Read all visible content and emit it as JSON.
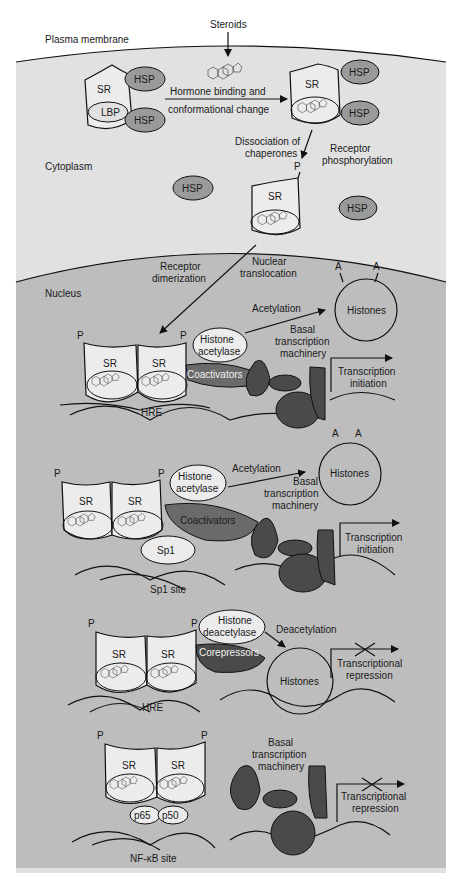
{
  "regions": {
    "plasma_membrane": "Plasma membrane",
    "cytoplasm": "Cytoplasm",
    "nucleus": "Nucleus"
  },
  "colors": {
    "cytoplasm": "#e1e1e1",
    "nucleus": "#bdbdbd",
    "receptor": "#e8e8e8",
    "hsp": "#9a9a9a",
    "dark_protein": "#4a4a4a",
    "coactivator": "#6a6a6a",
    "light_protein": "#ececec"
  },
  "cytoplasm_step": {
    "steroids": "Steroids",
    "sr": "SR",
    "lbp": "LBP",
    "hsp": "HSP",
    "hormone_binding_line1": "Hormone binding and",
    "hormone_binding_line2": "conformational change",
    "dissociation_line1": "Dissociation of",
    "dissociation_line2": "chaperones",
    "phospho_line1": "Receptor",
    "phospho_line2": "phosphorylation",
    "p": "P",
    "nuclear_line1": "Nuclear",
    "nuclear_line2": "translocation",
    "dimer_line1": "Receptor",
    "dimer_line2": "dimerization"
  },
  "panel1": {
    "sr": "SR",
    "p": "P",
    "histone_acetylase_line1": "Histone",
    "histone_acetylase_line2": "acetylase",
    "coactivators": "Coactivators",
    "acetylation": "Acetylation",
    "histones": "Histones",
    "a": "A",
    "basal_line1": "Basal",
    "basal_line2": "transcription",
    "basal_line3": "machinery",
    "tx_line1": "Transcription",
    "tx_line2": "initiation",
    "site": "HRE"
  },
  "panel2": {
    "sr": "SR",
    "p": "P",
    "histone_acetylase_line1": "Histone",
    "histone_acetylase_line2": "acetylase",
    "coactivators": "Coactivators",
    "sp1": "Sp1",
    "acetylation": "Acetylation",
    "histones": "Histones",
    "a": "A",
    "basal_line1": "Basal",
    "basal_line2": "transcription",
    "basal_line3": "machinery",
    "tx_line1": "Transcription",
    "tx_line2": "initiation",
    "site": "Sp1 site"
  },
  "panel3": {
    "sr": "SR",
    "p": "P",
    "hdac_line1": "Histone",
    "hdac_line2": "deacetylase",
    "corepressors": "Corepressors",
    "deacetylation": "Deacetylation",
    "histones": "Histones",
    "rep_line1": "Transcriptional",
    "rep_line2": "repression",
    "site": "HRE"
  },
  "panel4": {
    "sr": "SR",
    "p": "P",
    "p65": "p65",
    "p50": "p50",
    "basal_line1": "Basal",
    "basal_line2": "transcription",
    "basal_line3": "machinery",
    "rep_line1": "Transcriptional",
    "rep_line2": "repression",
    "site": "NF-κB site"
  }
}
